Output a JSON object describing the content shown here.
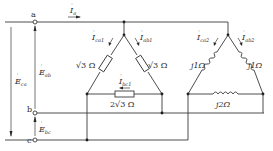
{
  "terminals": {
    "a": "a",
    "b": "b",
    "c": "c"
  },
  "sources": {
    "E_ab": {
      "symbol": "E",
      "sub": "ab"
    },
    "E_bc": {
      "symbol": "E",
      "sub": "bc"
    },
    "E_ca": {
      "symbol": "E",
      "sub": "ca"
    }
  },
  "currents": {
    "I_a": {
      "symbol": "I",
      "sub": "a"
    },
    "I_ca1": {
      "symbol": "I",
      "sub": "ca1"
    },
    "I_ab1": {
      "symbol": "I",
      "sub": "ab1"
    },
    "I_bc1": {
      "symbol": "I",
      "sub": "bc1"
    },
    "I_ca2": {
      "symbol": "I",
      "sub": "ca2"
    },
    "I_ab2": {
      "symbol": "I",
      "sub": "ab2"
    }
  },
  "load1": {
    "type": "delta-resistive",
    "z_ca": "√3 Ω",
    "z_ab": "√3 Ω",
    "z_bc": "2√3 Ω"
  },
  "load2": {
    "type": "delta-inductive",
    "z_ca": "j1Ω",
    "z_ab": "j1Ω",
    "z_bc": "j2Ω"
  },
  "colors": {
    "wire": "#3a3a3a",
    "text": "#2a2a2a",
    "background": "#ffffff"
  }
}
